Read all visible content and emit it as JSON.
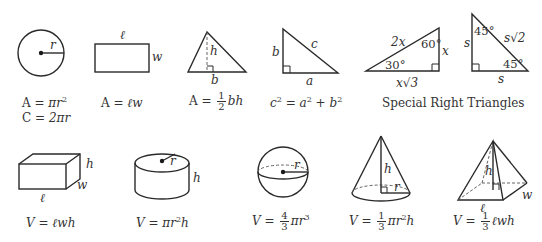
{
  "row1": {
    "circle": {
      "labels": {
        "radius": "r"
      },
      "formulas": {
        "area_lhs": "A",
        "area_rhs_pi": "π",
        "area_rhs_var": "r",
        "area_exp": "2",
        "circ_lhs": "C",
        "circ_rhs": "2πr"
      }
    },
    "rectangle": {
      "labels": {
        "length": "ℓ",
        "width": "w"
      },
      "formula": {
        "lhs": "A",
        "rhs": "ℓw"
      }
    },
    "triangle": {
      "labels": {
        "height": "h",
        "base": "b"
      },
      "formula": {
        "lhs": "A",
        "num": "1",
        "den": "2",
        "rhs": "bh"
      }
    },
    "right_triangle": {
      "labels": {
        "hyp": "c",
        "leg_vertical": "b",
        "leg_horizontal": "a"
      },
      "formula": {
        "c": "c",
        "a": "a",
        "b": "b",
        "exp": "2"
      }
    },
    "special_30_60_90": {
      "labels": {
        "hyp": "2x",
        "short_leg": "x",
        "long_leg": "x√3",
        "angle_small": "30°",
        "angle_large": "60°"
      }
    },
    "special_45_45_90": {
      "labels": {
        "leg_vertical": "s",
        "leg_horizontal": "s",
        "hyp": "s√2",
        "angle_top": "45°",
        "angle_bottom": "45°"
      }
    },
    "special_caption": "Special Right Triangles"
  },
  "row2": {
    "box": {
      "labels": {
        "length": "ℓ",
        "width": "w",
        "height": "h"
      },
      "formula": {
        "lhs": "V",
        "rhs": "ℓwh"
      }
    },
    "cylinder": {
      "labels": {
        "radius": "r",
        "height": "h"
      },
      "formula": {
        "lhs": "V",
        "pi": "π",
        "r": "r",
        "exp": "2",
        "h": "h"
      }
    },
    "sphere": {
      "labels": {
        "radius": "r"
      },
      "formula": {
        "lhs": "V",
        "num": "4",
        "den": "3",
        "pi": "π",
        "r": "r",
        "exp": "3"
      }
    },
    "cone": {
      "labels": {
        "height": "h",
        "radius": "r"
      },
      "formula": {
        "lhs": "V",
        "num": "1",
        "den": "3",
        "pi": "π",
        "r": "r",
        "exp": "2",
        "h": "h"
      }
    },
    "pyramid": {
      "labels": {
        "length": "ℓ",
        "width": "w",
        "height": "h"
      },
      "formula": {
        "lhs": "V",
        "num": "1",
        "den": "3",
        "rhs": "ℓwh"
      }
    }
  }
}
